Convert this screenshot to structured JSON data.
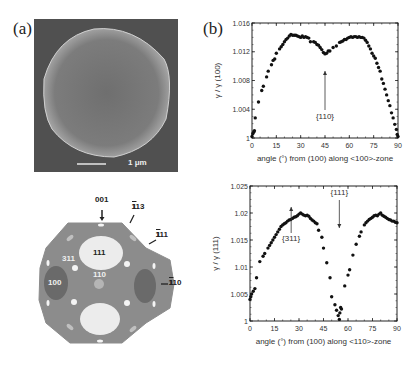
{
  "panels": {
    "a_label": "(a)",
    "b_label": "(b)"
  },
  "sem_image": {
    "scale_bar_label": "1 μm",
    "background_color": "#555555",
    "particle_color": "#8a8a8a"
  },
  "wulff_shape": {
    "labels": {
      "l001": "001",
      "l113": "113",
      "l111_edge": "111",
      "l110_edge": "110",
      "l111_face": "111",
      "l311": "311",
      "l110_center": "110",
      "l100": "100"
    },
    "colors": {
      "body": "#8c8c8c",
      "face_111": "#ececec",
      "face_100": "#6e6e6e",
      "small_facets": "#f4f4f4"
    }
  },
  "chart_data": [
    {
      "type": "scatter",
      "title": "",
      "xlabel": "angle (°) from (100) along <100>-zone",
      "ylabel": "γ / γ (100)",
      "xlim": [
        0,
        90
      ],
      "ylim": [
        1,
        1.016
      ],
      "xticks": [
        "0",
        "15",
        "30",
        "45",
        "60",
        "75",
        "90"
      ],
      "yticks": [
        "1",
        "1.004",
        "1.008",
        "1.012",
        "1.016"
      ],
      "annotations": [
        {
          "text": "{110}",
          "x": 45,
          "y": 1.0118
        }
      ],
      "x": [
        0,
        0.5,
        1,
        1.5,
        2,
        4,
        6,
        7,
        9,
        10,
        12,
        13,
        14,
        15,
        17,
        18,
        19,
        20,
        21,
        22,
        23,
        24,
        25,
        26,
        27,
        28,
        29,
        30,
        31,
        32,
        33,
        34,
        35,
        36,
        38,
        39,
        40,
        41,
        42,
        43,
        44,
        45,
        46,
        47,
        48,
        50,
        52,
        54,
        55,
        56,
        57,
        58,
        59,
        60,
        61,
        62,
        63,
        64,
        65,
        66,
        67,
        68,
        69,
        70,
        71,
        72,
        73,
        74,
        75,
        76,
        77,
        78,
        79,
        80,
        81,
        82,
        83,
        84,
        85,
        86,
        87,
        88,
        89,
        89.5,
        90
      ],
      "y": [
        1.0002,
        1.0006,
        1.0008,
        1.001,
        1.0028,
        1.005,
        1.0066,
        1.0072,
        1.0085,
        1.0093,
        1.0102,
        1.0108,
        1.011,
        1.0118,
        1.0124,
        1.0127,
        1.013,
        1.0134,
        1.0137,
        1.0139,
        1.0142,
        1.0144,
        1.0143,
        1.0143,
        1.0143,
        1.0142,
        1.0141,
        1.014,
        1.0142,
        1.014,
        1.0141,
        1.014,
        1.0139,
        1.0134,
        1.0134,
        1.0133,
        1.013,
        1.0129,
        1.0126,
        1.0123,
        1.0119,
        1.0117,
        1.0118,
        1.0121,
        1.0121,
        1.0126,
        1.0128,
        1.0133,
        1.0134,
        1.0135,
        1.0137,
        1.0137,
        1.0139,
        1.014,
        1.0141,
        1.014,
        1.0141,
        1.0141,
        1.014,
        1.0141,
        1.014,
        1.014,
        1.0139,
        1.0136,
        1.0133,
        1.0128,
        1.0124,
        1.0118,
        1.0114,
        1.0111,
        1.0104,
        1.0098,
        1.0093,
        1.0082,
        1.0076,
        1.0068,
        1.006,
        1.0052,
        1.0045,
        1.0035,
        1.0028,
        1.0019,
        1.0012,
        1.0005,
        1.0002
      ]
    },
    {
      "type": "scatter",
      "title": "",
      "xlabel": "angle (°) from (100) along <110>-zone",
      "ylabel": "γ / γ (111)",
      "xlim": [
        0,
        90
      ],
      "ylim": [
        1,
        1.025
      ],
      "xticks": [
        "0",
        "15",
        "30",
        "45",
        "60",
        "75",
        "90"
      ],
      "yticks": [
        "1",
        "1.005",
        "1.01",
        "1.015",
        "1.02",
        "1.025"
      ],
      "annotations": [
        {
          "text": "{311}",
          "x": 25.2,
          "y": 1.0188
        },
        {
          "text": "{111}",
          "x": 54.7,
          "y": 1.0
        }
      ],
      "x": [
        0,
        0.5,
        1,
        2,
        3,
        4,
        6,
        8,
        9,
        11,
        12,
        13,
        14,
        15,
        16,
        17,
        18,
        19,
        20,
        21,
        22,
        23,
        24,
        25,
        26,
        27,
        28,
        29,
        30,
        31,
        32,
        33,
        34,
        35,
        36,
        37,
        38,
        39,
        40,
        41,
        42,
        44,
        45,
        47,
        49,
        50,
        52,
        53,
        54,
        54.7,
        55,
        55.5,
        56,
        58,
        60,
        61,
        63,
        65,
        67,
        68,
        70,
        71,
        72,
        73,
        74,
        75,
        76,
        77,
        78,
        79,
        80,
        81,
        82,
        83,
        84,
        85,
        86,
        87,
        88,
        89,
        90
      ],
      "y": [
        1.004,
        1.0045,
        1.005,
        1.0055,
        1.006,
        1.008,
        1.011,
        1.012,
        1.0125,
        1.0135,
        1.014,
        1.0145,
        1.015,
        1.0155,
        1.016,
        1.0165,
        1.017,
        1.0175,
        1.0178,
        1.018,
        1.0182,
        1.0185,
        1.0187,
        1.0188,
        1.019,
        1.0192,
        1.0193,
        1.0195,
        1.0198,
        1.02,
        1.0198,
        1.0196,
        1.0195,
        1.0196,
        1.0194,
        1.019,
        1.0187,
        1.0185,
        1.0182,
        1.018,
        1.0168,
        1.0155,
        1.0135,
        1.0108,
        1.008,
        1.0045,
        1.003,
        1.002,
        1.001,
        1.0003,
        1.0015,
        1.0025,
        1.0022,
        1.0065,
        1.0085,
        1.0095,
        1.0122,
        1.0142,
        1.0157,
        1.0165,
        1.0178,
        1.0182,
        1.0185,
        1.0188,
        1.019,
        1.0192,
        1.0195,
        1.0196,
        1.0195,
        1.0198,
        1.02,
        1.0196,
        1.0194,
        1.0192,
        1.019,
        1.0188,
        1.0187,
        1.0185,
        1.0185,
        1.0183,
        1.0182
      ]
    }
  ]
}
